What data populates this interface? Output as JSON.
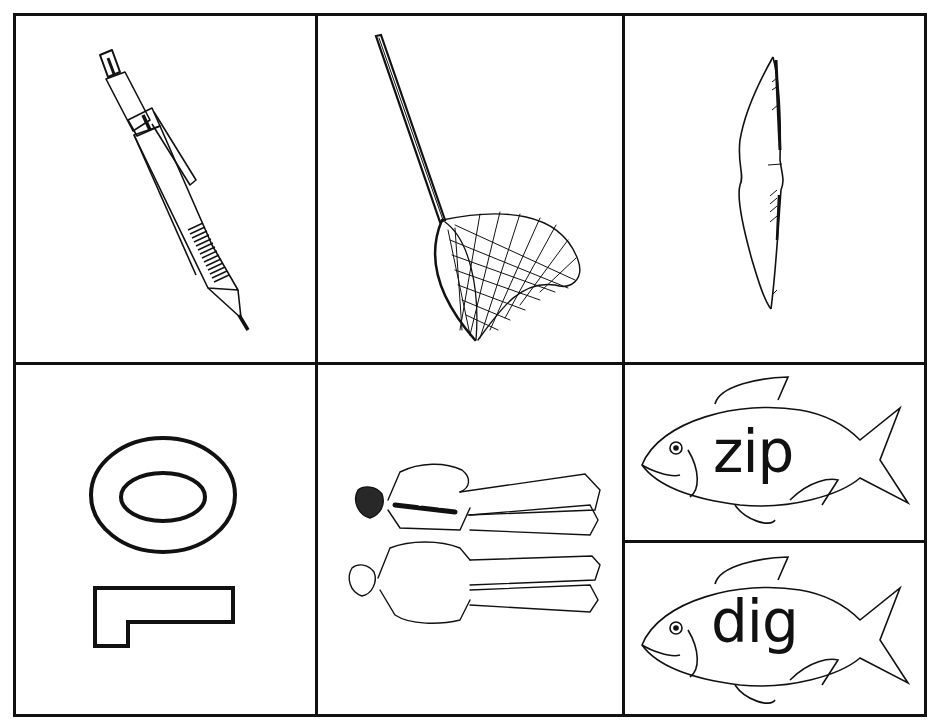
{
  "worksheet": {
    "title": "Picture and word cards",
    "line_color": "#111111",
    "background_color": "#ffffff",
    "cards": [
      {
        "id": "pen",
        "icon": "pen-icon",
        "label": "pen"
      },
      {
        "id": "net",
        "icon": "net-icon",
        "label": "net"
      },
      {
        "id": "pillow",
        "icon": "pillow-icon",
        "label": "pillow"
      },
      {
        "id": "ten",
        "icon": "number-ten-icon",
        "label": "10"
      },
      {
        "id": "men",
        "icon": "men-icon",
        "label": "men"
      },
      {
        "id": "fish-zip",
        "icon": "fish-icon",
        "word": "zip"
      },
      {
        "id": "fish-dig",
        "icon": "fish-icon",
        "word": "dig"
      }
    ]
  }
}
